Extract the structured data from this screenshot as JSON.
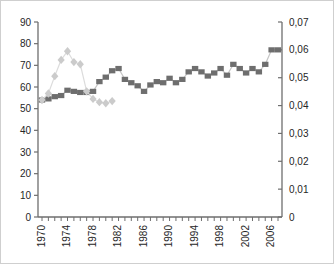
{
  "chart_data": {
    "type": "line",
    "title": "",
    "legend": false,
    "grid": false,
    "background": "#ffffff",
    "frame_border_color": "#cfcfcf",
    "axis_color": "#6e6e6e",
    "label_color": "#262626",
    "x_axis": {
      "min": 1970,
      "max": 2007,
      "minor_tick_every": 1,
      "label_every": 4,
      "tick_labels": [
        "1970",
        "1974",
        "1978",
        "1982",
        "1986",
        "1990",
        "1994",
        "1998",
        "2002",
        "2006"
      ],
      "label_rotation_deg": -90
    },
    "left_axis": {
      "min": 0,
      "max": 90,
      "step": 10,
      "tick_labels": [
        "0",
        "10",
        "20",
        "30",
        "40",
        "50",
        "60",
        "70",
        "80",
        "90"
      ]
    },
    "right_axis": {
      "min": 0,
      "max": 0.07,
      "step": 0.01,
      "tick_labels": [
        "0",
        "0,01",
        "0,02",
        "0,03",
        "0,04",
        "0,05",
        "0,06",
        "0,07"
      ]
    },
    "series": [
      {
        "name": "dark-square-series",
        "axis": "right",
        "marker": "square",
        "marker_color": "#6e6e6e",
        "line_color": "#c6c6c6",
        "x": [
          1970,
          1971,
          1972,
          1973,
          1974,
          1975,
          1976,
          1977,
          1978,
          1979,
          1980,
          1981,
          1982,
          1983,
          1984,
          1985,
          1986,
          1987,
          1988,
          1989,
          1990,
          1991,
          1992,
          1993,
          1994,
          1995,
          1996,
          1997,
          1998,
          1999,
          2000,
          2001,
          2002,
          2003,
          2004,
          2005,
          2006,
          2007
        ],
        "values": [
          0.042,
          0.0424,
          0.0432,
          0.0436,
          0.0455,
          0.0451,
          0.0447,
          0.0447,
          0.0451,
          0.0486,
          0.0502,
          0.0525,
          0.0533,
          0.0494,
          0.0482,
          0.0471,
          0.0451,
          0.0474,
          0.0486,
          0.0482,
          0.0498,
          0.0482,
          0.0494,
          0.0521,
          0.0533,
          0.0521,
          0.0506,
          0.0517,
          0.0533,
          0.0509,
          0.0548,
          0.0533,
          0.0517,
          0.0533,
          0.0521,
          0.0548,
          0.06,
          0.06
        ]
      },
      {
        "name": "light-diamond-series",
        "axis": "left",
        "marker": "diamond",
        "marker_color": "#cbcbcb",
        "line_color": "#dcdcdc",
        "x": [
          1970,
          1971,
          1972,
          1973,
          1974,
          1975,
          1976,
          1977,
          1978,
          1979,
          1980,
          1981
        ],
        "values": [
          54,
          57,
          65,
          72.5,
          76.5,
          71.5,
          70.5,
          58,
          54.5,
          53,
          52.5,
          53.5
        ]
      }
    ]
  }
}
